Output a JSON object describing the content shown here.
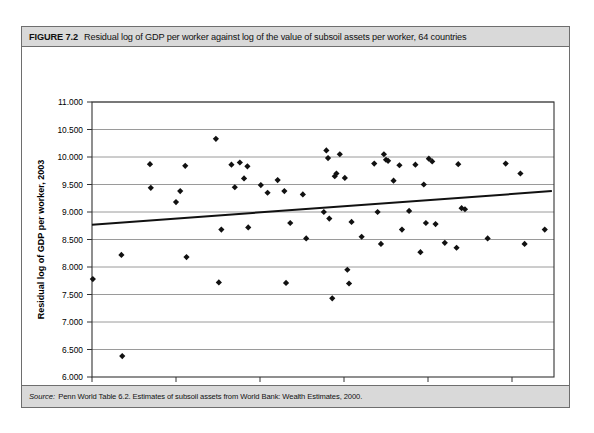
{
  "figure": {
    "label": "FIGURE 7.2",
    "title": "Residual log of GDP per worker against log of the value of subsoil assets per worker, 64 countries",
    "source_label": "Source:",
    "source_text": "Penn World Table 6.2. Estimates of subsoil assets from World Bank: Wealth Estimates, 2000."
  },
  "chart_data": {
    "type": "scatter",
    "title": "Residual log of GDP per worker against log of the value of subsoil assets per worker, 64 countries",
    "xlabel": "Log of subsoil assets per worker, 2000",
    "ylabel": "Residual log of GDP per worker, 2003",
    "xlim": [
      0.0,
      11.0
    ],
    "ylim": [
      6.0,
      11.0
    ],
    "grid": "horizontal",
    "legend": "none",
    "xticks": [
      0.0,
      2.0,
      4.0,
      6.0,
      8.0,
      10.0
    ],
    "xtick_labels": [
      "0.000",
      "2.000",
      "4.000",
      "6.000",
      "8.000",
      "10.000"
    ],
    "yticks": [
      6.0,
      6.5,
      7.0,
      7.5,
      8.0,
      8.5,
      9.0,
      9.5,
      10.0,
      10.5,
      11.0
    ],
    "ytick_labels": [
      "6.000",
      "6.500",
      "7.000",
      "7.500",
      "8.000",
      "8.500",
      "9.000",
      "9.500",
      "10.000",
      "10.500",
      "11.000"
    ],
    "n_points": 64,
    "marker": "diamond",
    "marker_color": "#111111",
    "trendline": {
      "type": "linear",
      "color": "#111111",
      "x_start": 0.0,
      "y_start": 8.77,
      "x_end": 10.95,
      "y_end": 9.38
    },
    "points": [
      {
        "x": 0.02,
        "y": 7.78
      },
      {
        "x": 0.7,
        "y": 8.22
      },
      {
        "x": 0.72,
        "y": 6.38
      },
      {
        "x": 1.38,
        "y": 9.87
      },
      {
        "x": 1.4,
        "y": 9.44
      },
      {
        "x": 2.0,
        "y": 9.18
      },
      {
        "x": 2.1,
        "y": 9.38
      },
      {
        "x": 2.22,
        "y": 9.84
      },
      {
        "x": 2.25,
        "y": 8.18
      },
      {
        "x": 2.95,
        "y": 10.33
      },
      {
        "x": 3.02,
        "y": 7.72
      },
      {
        "x": 3.08,
        "y": 8.68
      },
      {
        "x": 3.32,
        "y": 9.86
      },
      {
        "x": 3.4,
        "y": 9.45
      },
      {
        "x": 3.52,
        "y": 9.9
      },
      {
        "x": 3.62,
        "y": 9.61
      },
      {
        "x": 3.7,
        "y": 9.83
      },
      {
        "x": 3.72,
        "y": 8.72
      },
      {
        "x": 4.02,
        "y": 9.49
      },
      {
        "x": 4.18,
        "y": 9.35
      },
      {
        "x": 4.42,
        "y": 9.58
      },
      {
        "x": 4.58,
        "y": 9.38
      },
      {
        "x": 4.62,
        "y": 7.71
      },
      {
        "x": 4.72,
        "y": 8.8
      },
      {
        "x": 5.02,
        "y": 9.32
      },
      {
        "x": 5.1,
        "y": 8.52
      },
      {
        "x": 5.52,
        "y": 9.0
      },
      {
        "x": 5.58,
        "y": 10.12
      },
      {
        "x": 5.62,
        "y": 9.98
      },
      {
        "x": 5.65,
        "y": 8.88
      },
      {
        "x": 5.72,
        "y": 7.43
      },
      {
        "x": 5.78,
        "y": 9.65
      },
      {
        "x": 5.82,
        "y": 9.7
      },
      {
        "x": 5.9,
        "y": 10.05
      },
      {
        "x": 6.02,
        "y": 9.62
      },
      {
        "x": 6.08,
        "y": 7.95
      },
      {
        "x": 6.12,
        "y": 7.7
      },
      {
        "x": 6.18,
        "y": 8.82
      },
      {
        "x": 6.42,
        "y": 8.55
      },
      {
        "x": 6.72,
        "y": 9.88
      },
      {
        "x": 6.8,
        "y": 9.0
      },
      {
        "x": 6.88,
        "y": 8.42
      },
      {
        "x": 6.95,
        "y": 10.05
      },
      {
        "x": 7.0,
        "y": 9.95
      },
      {
        "x": 7.05,
        "y": 9.93
      },
      {
        "x": 7.18,
        "y": 9.57
      },
      {
        "x": 7.32,
        "y": 9.85
      },
      {
        "x": 7.38,
        "y": 8.68
      },
      {
        "x": 7.55,
        "y": 9.02
      },
      {
        "x": 7.7,
        "y": 9.86
      },
      {
        "x": 7.82,
        "y": 8.27
      },
      {
        "x": 7.9,
        "y": 9.5
      },
      {
        "x": 7.95,
        "y": 8.8
      },
      {
        "x": 8.02,
        "y": 9.97
      },
      {
        "x": 8.1,
        "y": 9.92
      },
      {
        "x": 8.18,
        "y": 8.78
      },
      {
        "x": 8.4,
        "y": 8.44
      },
      {
        "x": 8.68,
        "y": 8.35
      },
      {
        "x": 8.72,
        "y": 9.87
      },
      {
        "x": 8.8,
        "y": 9.07
      },
      {
        "x": 8.88,
        "y": 9.05
      },
      {
        "x": 9.42,
        "y": 8.52
      },
      {
        "x": 9.85,
        "y": 9.88
      },
      {
        "x": 10.2,
        "y": 9.7
      },
      {
        "x": 10.3,
        "y": 8.42
      },
      {
        "x": 10.78,
        "y": 8.68
      }
    ]
  }
}
